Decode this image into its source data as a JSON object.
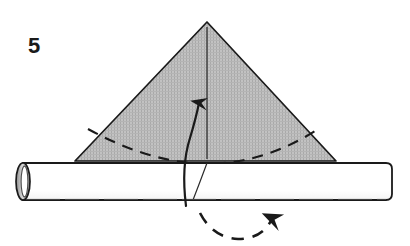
{
  "figure": {
    "kind": "origami-instruction-diagram",
    "step_number": "5",
    "caption": "",
    "background_color": "#ffffff",
    "ink_color": "#1a1a1a",
    "paper_fill_color": "#b9b9b9",
    "tube_fill_color": "#ffffff",
    "canvas": {
      "width": 410,
      "height": 246
    }
  },
  "parts": {
    "step_label": {
      "name": "step-number",
      "value": "5",
      "x": 28,
      "y": 53
    },
    "triangle": {
      "name": "folded-paper-triangle",
      "apex": {
        "x": 207,
        "y": 22
      },
      "base_left": {
        "x": 75,
        "y": 161
      },
      "base_right": {
        "x": 336,
        "y": 161
      },
      "fill": "#b9b9b9",
      "stroke": "#1a1a1a"
    },
    "center_crease": {
      "name": "vertical-center-crease",
      "from": {
        "x": 207,
        "y": 28
      },
      "to": {
        "x": 207,
        "y": 158
      },
      "style": "solid"
    },
    "fold_line": {
      "name": "dashed-fold-line",
      "style": "dashed",
      "left_end": {
        "x": 88,
        "y": 128
      },
      "mid": {
        "x": 207,
        "y": 163
      },
      "right_end": {
        "x": 320,
        "y": 127
      }
    },
    "fold_arrow": {
      "name": "fold-up-arrow",
      "style": "solid-curved-arrow",
      "tail": {
        "x": 186,
        "y": 205
      },
      "tip": {
        "x": 199,
        "y": 96
      },
      "direction": "up"
    },
    "rotate_arrow": {
      "name": "rotate-arrow",
      "style": "dashed-curved-arrow",
      "start": {
        "x": 200,
        "y": 214
      },
      "dip": {
        "x": 237,
        "y": 239
      },
      "tip": {
        "x": 274,
        "y": 213
      },
      "direction": "up-right"
    },
    "tube": {
      "name": "paper-tube",
      "left": 16,
      "right": 392,
      "top": 163,
      "bottom": 200,
      "fill": "#ffffff",
      "stroke": "#1a1a1a",
      "open_end": {
        "name": "tube-open-end-ellipse",
        "cx": 23,
        "cy": 182,
        "rx": 7,
        "ry": 19
      }
    },
    "tube_seam": {
      "name": "tube-seam-line",
      "from": {
        "x": 207,
        "y": 163
      },
      "to": {
        "x": 193,
        "y": 200
      }
    }
  }
}
